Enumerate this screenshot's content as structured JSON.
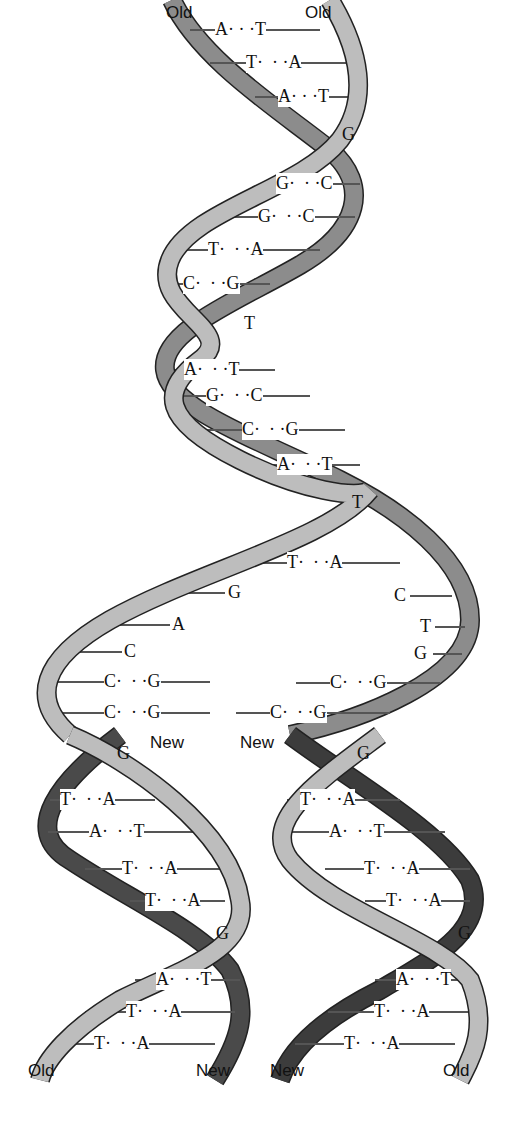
{
  "colors": {
    "old_strand": "#8c8c8c",
    "old_strand_light": "#bdbdbd",
    "new_strand": "#4a4a4a",
    "outline": "#222222",
    "rung": "#555555",
    "background": "#ffffff"
  },
  "labels": {
    "top_left": "Old",
    "top_right": "Old",
    "fork_left_new": "New",
    "fork_right_new": "New",
    "bottom_left_1": "Old",
    "bottom_left_2": "New",
    "bottom_right_1": "New",
    "bottom_right_2": "Old"
  },
  "parent_helix": {
    "base_pairs": [
      {
        "left": "A",
        "right": "T",
        "y": 30
      },
      {
        "left": "T",
        "right": "A",
        "y": 63
      },
      {
        "left": "A",
        "right": "T",
        "y": 97
      },
      {
        "single": "G",
        "y": 135
      },
      {
        "left": "G",
        "right": "C",
        "y": 184
      },
      {
        "left": "G",
        "right": "C",
        "y": 217
      },
      {
        "left": "T",
        "right": "A",
        "y": 250
      },
      {
        "left": "C",
        "right": "G",
        "y": 284
      },
      {
        "single": "T",
        "y": 324
      },
      {
        "left": "A",
        "right": "T",
        "y": 370
      },
      {
        "left": "G",
        "right": "C",
        "y": 396
      },
      {
        "left": "C",
        "right": "G",
        "y": 430
      },
      {
        "left": "A",
        "right": "T",
        "y": 465
      },
      {
        "single": "T",
        "y": 503
      }
    ]
  },
  "fork": {
    "top_pair": {
      "left": "T",
      "right": "A",
      "y": 563
    },
    "left_unpaired": [
      "G",
      "A",
      "C"
    ],
    "right_unpaired": [
      "C",
      "T",
      "G"
    ],
    "left_pairs": [
      {
        "left": "C",
        "right": "G"
      },
      {
        "left": "C",
        "right": "G"
      }
    ],
    "right_pairs": [
      {
        "left": "C",
        "right": "G"
      },
      {
        "left": "C",
        "right": "G"
      }
    ]
  },
  "daughter_left": {
    "top_single": "G",
    "base_pairs": [
      {
        "left": "T",
        "right": "A"
      },
      {
        "left": "A",
        "right": "T"
      },
      {
        "left": "T",
        "right": "A"
      },
      {
        "left": "T",
        "right": "A"
      }
    ],
    "mid_single": "G",
    "bottom_pairs": [
      {
        "left": "A",
        "right": "T"
      },
      {
        "left": "T",
        "right": "A"
      },
      {
        "left": "T",
        "right": "A"
      }
    ]
  },
  "daughter_right": {
    "top_single": "G",
    "base_pairs": [
      {
        "left": "T",
        "right": "A"
      },
      {
        "left": "A",
        "right": "T"
      },
      {
        "left": "T",
        "right": "A"
      },
      {
        "left": "T",
        "right": "A"
      }
    ],
    "mid_single": "G",
    "bottom_pairs": [
      {
        "left": "A",
        "right": "T"
      },
      {
        "left": "T",
        "right": "A"
      },
      {
        "left": "T",
        "right": "A"
      }
    ]
  }
}
